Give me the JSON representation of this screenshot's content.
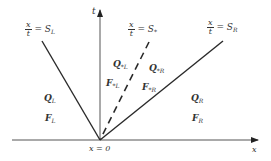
{
  "diagram": {
    "axes": {
      "t_label": "t",
      "x_label": "x",
      "origin_label": "x = 0"
    },
    "waves": [
      {
        "id": "left",
        "frac_num": "x",
        "frac_den": "t",
        "eq": "= S",
        "sub": "L",
        "style": "solid"
      },
      {
        "id": "contact",
        "frac_num": "x",
        "frac_den": "t",
        "eq": "= S",
        "sub": "*",
        "style": "dashed"
      },
      {
        "id": "right",
        "frac_num": "x",
        "frac_den": "t",
        "eq": "= S",
        "sub": "R",
        "style": "solid"
      }
    ],
    "regions": {
      "QL": {
        "sym": "Q",
        "sub": "L"
      },
      "FL": {
        "sym": "F",
        "sub": "L"
      },
      "QsL": {
        "sym": "Q",
        "sub": "*L"
      },
      "FsL": {
        "sym": "F",
        "sub": "*L"
      },
      "QsR": {
        "sym": "Q",
        "sub": "*R"
      },
      "FsR": {
        "sym": "F",
        "sub": "*R"
      },
      "QR": {
        "sym": "Q",
        "sub": "R"
      },
      "FR": {
        "sym": "F",
        "sub": "R"
      }
    },
    "colors": {
      "line": "#2a2a2a",
      "axis": "#555555"
    }
  }
}
